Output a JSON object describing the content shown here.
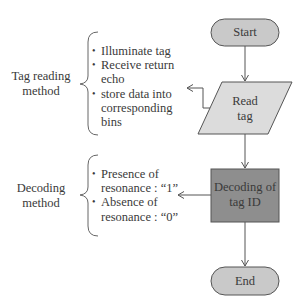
{
  "diagram": {
    "type": "flowchart",
    "nodes": [
      {
        "id": "start",
        "shape": "terminal",
        "label": "Start",
        "fill": "#c9c9c9"
      },
      {
        "id": "read_tag",
        "shape": "parallelogram",
        "label_line1": "Read",
        "label_line2": "tag",
        "fill": "#dcdcdc"
      },
      {
        "id": "decode",
        "shape": "rectangle",
        "label_line1": "Decoding of",
        "label_line2": "tag ID",
        "fill": "#8e8e8e"
      },
      {
        "id": "end",
        "shape": "terminal",
        "label": "End",
        "fill": "#c9c9c9"
      }
    ],
    "edges": [
      {
        "from": "start",
        "to": "read_tag"
      },
      {
        "from": "read_tag",
        "to": "decode"
      },
      {
        "from": "decode",
        "to": "end"
      },
      {
        "from": "read_tag",
        "to": "tag_reading_annotation"
      },
      {
        "from": "decode",
        "to": "decoding_annotation"
      }
    ],
    "annotations": {
      "tag_reading": {
        "title_line1": "Tag reading",
        "title_line2": "method",
        "items": [
          {
            "line1": "Illuminate tag"
          },
          {
            "line1": "Receive return",
            "line2": "echo"
          },
          {
            "line1": "store data into",
            "line2": "corresponding",
            "line3": "bins"
          }
        ]
      },
      "decoding": {
        "title_line1": "Decoding",
        "title_line2": "method",
        "items": [
          {
            "line1": "Presence of",
            "line2": "resonance : “1”"
          },
          {
            "line1": "Absence of",
            "line2": "resonance : “0”"
          }
        ]
      }
    },
    "colors": {
      "line": "#555555",
      "terminal_fill": "#c9c9c9",
      "io_fill": "#dcdcdc",
      "process_fill": "#8e8e8e",
      "border": "#555555"
    }
  }
}
